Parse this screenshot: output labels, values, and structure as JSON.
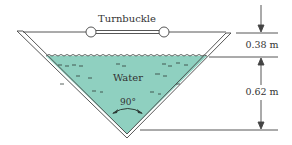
{
  "diagram": {
    "labels": {
      "turnbuckle": "Turnbuckle",
      "water": "Water",
      "angle": "90°",
      "top_gap": "0.38 m",
      "water_depth": "0.62 m"
    },
    "colors": {
      "water": "#8fd0c0",
      "line": "#444444",
      "background": "#ffffff"
    },
    "dimensions": {
      "freeboard_m": 0.38,
      "water_depth_m": 0.62,
      "vertex_angle_deg": 90
    }
  }
}
